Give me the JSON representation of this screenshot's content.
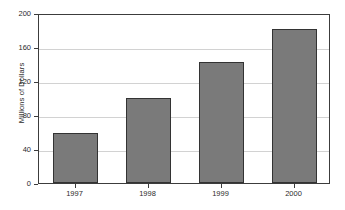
{
  "chart_data": {
    "type": "bar",
    "title": "",
    "xlabel": "",
    "ylabel": "Millions of Dollars",
    "categories": [
      "1997",
      "1998",
      "1999",
      "2000"
    ],
    "values": [
      59,
      100,
      142,
      181
    ],
    "series": [
      {
        "name": "Millions of Dollars",
        "values": [
          59,
          100,
          142,
          181
        ]
      }
    ],
    "ylim": [
      0,
      200
    ],
    "ytick_labels": [
      "0",
      "40",
      "80",
      "120",
      "160",
      "200"
    ],
    "ytick_values": [
      0,
      40,
      80,
      120,
      160,
      200
    ],
    "grid": "horizontal",
    "legend": "none",
    "bar_color": "#7a7a7a",
    "bar_edge_color": "#333333",
    "grid_color": "#d2d2d2",
    "axis_color": "#3c3c3c",
    "background_color": "#ffffff"
  },
  "figure": {
    "clipped_title": "",
    "axis_title_y": "Millions of Dollars"
  }
}
